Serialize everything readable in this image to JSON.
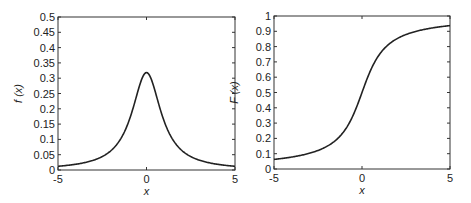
{
  "chart_data": [
    {
      "type": "line",
      "title": "",
      "xlabel": "x",
      "ylabel": "f (x)",
      "xlim": [
        -5,
        5
      ],
      "ylim": [
        0,
        0.5
      ],
      "grid": false,
      "xticks": [
        -5,
        0,
        5
      ],
      "xtick_labels": [
        "-5",
        "0",
        "5"
      ],
      "yticks": [
        0,
        0.05,
        0.1,
        0.15,
        0.2,
        0.25,
        0.3,
        0.35,
        0.4,
        0.45,
        0.5
      ],
      "ytick_labels": [
        "0",
        "0.05",
        "0.1",
        "0.15",
        "0.2",
        "0.25",
        "0.3",
        "0.35",
        "0.4",
        "0.45",
        "0.5"
      ],
      "series": [
        {
          "name": "f(x)",
          "color": "#222222",
          "x": [
            -5,
            -4.5,
            -4,
            -3.5,
            -3,
            -2.5,
            -2,
            -1.5,
            -1,
            -0.75,
            -0.5,
            -0.25,
            0,
            0.25,
            0.5,
            0.75,
            1,
            1.5,
            2,
            2.5,
            3,
            3.5,
            4,
            4.5,
            5
          ],
          "y": [
            0.0122,
            0.015,
            0.0187,
            0.0244,
            0.0318,
            0.0439,
            0.0637,
            0.0979,
            0.1592,
            0.2037,
            0.2546,
            0.2996,
            0.3183,
            0.2996,
            0.2546,
            0.2037,
            0.1592,
            0.0979,
            0.0637,
            0.0439,
            0.0318,
            0.0244,
            0.0187,
            0.015,
            0.0122
          ]
        }
      ]
    },
    {
      "type": "line",
      "title": "",
      "xlabel": "x",
      "ylabel": "F (x)",
      "xlim": [
        -5,
        5
      ],
      "ylim": [
        0,
        1
      ],
      "grid": false,
      "xticks": [
        -5,
        0,
        5
      ],
      "xtick_labels": [
        "-5",
        "0",
        "5"
      ],
      "yticks": [
        0,
        0.1,
        0.2,
        0.3,
        0.4,
        0.5,
        0.6,
        0.7,
        0.8,
        0.9,
        1
      ],
      "ytick_labels": [
        "0",
        "0.1",
        "0.2",
        "0.3",
        "0.4",
        "0.5",
        "0.6",
        "0.7",
        "0.8",
        "0.9",
        "1"
      ],
      "series": [
        {
          "name": "F(x)",
          "color": "#222222",
          "x": [
            -5,
            -4.5,
            -4,
            -3.5,
            -3,
            -2.5,
            -2,
            -1.5,
            -1,
            -0.75,
            -0.5,
            -0.25,
            0,
            0.25,
            0.5,
            0.75,
            1,
            1.5,
            2,
            2.5,
            3,
            3.5,
            4,
            4.5,
            5
          ],
          "y": [
            0.0628,
            0.0699,
            0.078,
            0.0886,
            0.1024,
            0.1211,
            0.1476,
            0.1872,
            0.25,
            0.2952,
            0.3524,
            0.422,
            0.5,
            0.578,
            0.6476,
            0.7048,
            0.75,
            0.8128,
            0.8524,
            0.8789,
            0.8976,
            0.9114,
            0.922,
            0.9301,
            0.9372
          ]
        }
      ]
    }
  ]
}
